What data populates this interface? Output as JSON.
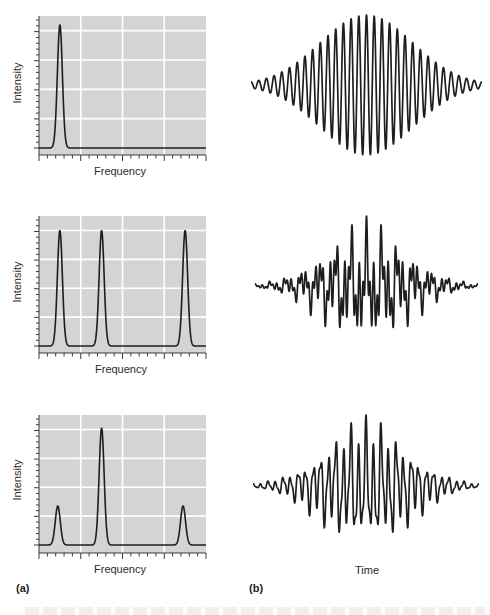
{
  "figure": {
    "panel_letters": [
      "(a)",
      "(b)"
    ],
    "spectrum_xlabel": "Frequency",
    "spectrum_ylabel": "Intensity",
    "time_xlabel": "Time"
  },
  "colors": {
    "panel_bg": "#d4d4d4",
    "gridline": "#ffffff",
    "trace": "#1e1e1e",
    "axis": "#3a3a3a"
  },
  "chart_data": [
    {
      "type": "line",
      "title": "",
      "panel": "a-1",
      "xlabel": "Frequency",
      "ylabel": "Intensity",
      "grid": true,
      "xlim": [
        0,
        4
      ],
      "ylim": [
        0,
        4.5
      ],
      "x_major_ticks": [
        0,
        1,
        2,
        3,
        4
      ],
      "x_minor_per_major": 5,
      "y_major_gridlines": [
        1,
        2,
        3,
        4
      ],
      "peaks": [
        {
          "center": 0.5,
          "height": 4.2,
          "width": 0.06
        }
      ]
    },
    {
      "type": "line",
      "title": "",
      "panel": "a-2",
      "xlabel": "Frequency",
      "ylabel": "Intensity",
      "grid": true,
      "xlim": [
        0,
        4
      ],
      "ylim": [
        0,
        4.5
      ],
      "x_major_ticks": [
        0,
        1,
        2,
        3,
        4
      ],
      "x_minor_per_major": 5,
      "y_major_gridlines": [
        1,
        2,
        3,
        4
      ],
      "peaks": [
        {
          "center": 0.5,
          "height": 4.0,
          "width": 0.06
        },
        {
          "center": 1.5,
          "height": 4.0,
          "width": 0.06
        },
        {
          "center": 3.5,
          "height": 4.0,
          "width": 0.06
        }
      ]
    },
    {
      "type": "line",
      "title": "",
      "panel": "a-3",
      "xlabel": "Frequency",
      "ylabel": "Intensity",
      "grid": true,
      "xlim": [
        0,
        4
      ],
      "ylim": [
        0,
        4.5
      ],
      "x_major_ticks": [
        0,
        1,
        2,
        3,
        4
      ],
      "x_minor_per_major": 5,
      "y_major_gridlines": [
        1,
        2,
        3,
        4
      ],
      "peaks": [
        {
          "center": 0.45,
          "height": 1.35,
          "width": 0.06
        },
        {
          "center": 1.5,
          "height": 4.05,
          "width": 0.06
        },
        {
          "center": 3.45,
          "height": 1.35,
          "width": 0.06
        }
      ]
    },
    {
      "type": "line",
      "title": "",
      "panel": "b-1",
      "xlabel": "",
      "ylabel": "",
      "grid": false,
      "description": "Gaussian-enveloped single-frequency oscillation",
      "x_range": [
        0,
        1
      ],
      "envelope_sigma": 0.2,
      "components": [
        {
          "cycles": 30,
          "amplitude": 1.0,
          "phase": 0
        }
      ]
    },
    {
      "type": "line",
      "title": "",
      "panel": "b-2",
      "xlabel": "",
      "ylabel": "",
      "grid": false,
      "description": "Gaussian-enveloped sum of three equal-amplitude frequencies",
      "x_range": [
        0,
        1
      ],
      "envelope_sigma": 0.19,
      "components": [
        {
          "cycles": 14,
          "amplitude": 1.0,
          "phase": 0
        },
        {
          "cycles": 30,
          "amplitude": 1.0,
          "phase": 0
        },
        {
          "cycles": 62,
          "amplitude": 1.0,
          "phase": 0
        }
      ]
    },
    {
      "type": "line",
      "title": "",
      "panel": "b-3",
      "xlabel": "Time",
      "ylabel": "",
      "grid": false,
      "description": "Gaussian-enveloped sum: strong middle frequency, weak outer frequencies",
      "x_range": [
        0,
        1
      ],
      "envelope_sigma": 0.19,
      "components": [
        {
          "cycles": 14,
          "amplitude": 0.33,
          "phase": 0
        },
        {
          "cycles": 30,
          "amplitude": 1.0,
          "phase": 0
        },
        {
          "cycles": 62,
          "amplitude": 0.33,
          "phase": 0
        }
      ]
    }
  ]
}
